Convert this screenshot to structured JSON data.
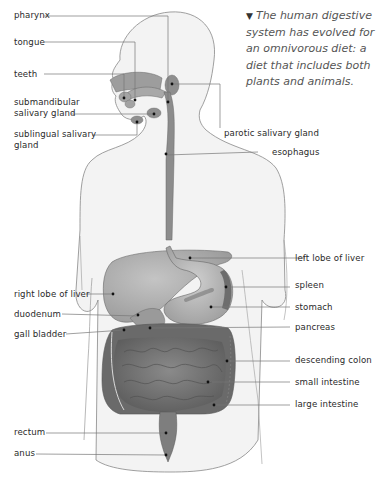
{
  "caption": {
    "marker": "▼",
    "text": "The human digestive system has evolved for an omnivorous diet: a diet that includes both plants and animals."
  },
  "labels": {
    "pharynx": "pharynx",
    "tongue": "tongue",
    "teeth": "teeth",
    "submandibular_1": "submandibular",
    "submandibular_2": "salivary gland",
    "sublingual_1": "sublingual salivary",
    "sublingual_2": "gland",
    "parotic": "parotic salivary gland",
    "esophagus": "esophagus",
    "left_liver": "left lobe of liver",
    "spleen": "spleen",
    "stomach": "stomach",
    "pancreas": "pancreas",
    "right_liver": "right lobe of liver",
    "duodenum": "duodenum",
    "gall_bladder": "gall bladder",
    "descending_colon": "descending colon",
    "small_intestine": "small intestine",
    "large_intestine": "large intestine",
    "rectum": "rectum",
    "anus": "anus"
  },
  "colors": {
    "body_fill": "#f2f2f2",
    "organ_dark": "#6e6e6e",
    "organ_mid": "#9a9a9a",
    "organ_light": "#bdbdbd",
    "leader": "#777777"
  }
}
